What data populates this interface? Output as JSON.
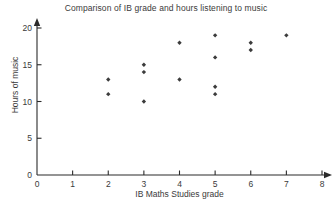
{
  "chart_data": {
    "type": "scatter",
    "title": "Comparison of IB grade and hours listening to music",
    "xlabel": "IB Maths Studies grade",
    "ylabel": "Hours of music",
    "xlim": [
      0,
      8
    ],
    "ylim": [
      0,
      20
    ],
    "xticks": [
      "0",
      "1",
      "2",
      "3",
      "4",
      "5",
      "6",
      "7",
      "8"
    ],
    "yticks": [
      "0",
      "5",
      "10",
      "15",
      "20"
    ],
    "grid": false,
    "legend": false,
    "marker": "diamond",
    "marker_color": "#3c3c3c",
    "points": [
      {
        "x": 2,
        "y": 13
      },
      {
        "x": 2,
        "y": 11
      },
      {
        "x": 3,
        "y": 15
      },
      {
        "x": 3,
        "y": 14
      },
      {
        "x": 3,
        "y": 10
      },
      {
        "x": 4,
        "y": 18
      },
      {
        "x": 4,
        "y": 13
      },
      {
        "x": 5,
        "y": 19
      },
      {
        "x": 5,
        "y": 16
      },
      {
        "x": 5,
        "y": 12
      },
      {
        "x": 5,
        "y": 11
      },
      {
        "x": 6,
        "y": 18
      },
      {
        "x": 6,
        "y": 17
      },
      {
        "x": 7,
        "y": 19
      }
    ]
  }
}
